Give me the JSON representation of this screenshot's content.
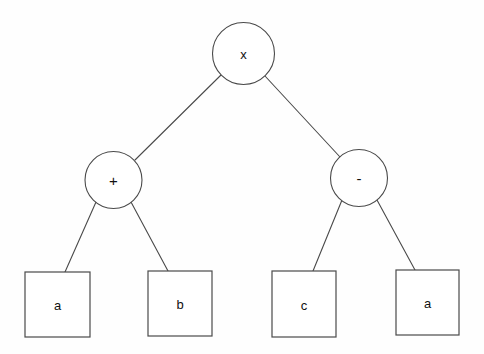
{
  "diagram": {
    "background_color": "#fefefe",
    "stroke_color": "#4a4a4a",
    "text_color": "#111111",
    "nodes": {
      "root": {
        "label": "x",
        "shape": "circle",
        "cx": 243.5,
        "cy": 53.5,
        "r": 31
      },
      "op_left": {
        "label": "+",
        "shape": "circle",
        "cx": 113.5,
        "cy": 180,
        "r": 28.5
      },
      "op_right": {
        "label": "-",
        "shape": "circle",
        "cx": 359,
        "cy": 178,
        "r": 28.5
      },
      "leaf_a1": {
        "label": "a",
        "shape": "square",
        "x": 25,
        "y": 272,
        "width": 65,
        "height": 65
      },
      "leaf_b": {
        "label": "b",
        "shape": "square",
        "x": 148,
        "y": 271,
        "width": 64,
        "height": 65
      },
      "leaf_c": {
        "label": "c",
        "shape": "square",
        "x": 272,
        "y": 271,
        "width": 64,
        "height": 66
      },
      "leaf_a2": {
        "label": "a",
        "shape": "square",
        "x": 396,
        "y": 270,
        "width": 63,
        "height": 65
      }
    },
    "edges": [
      {
        "from": "root",
        "to": "op_left",
        "x1": 221,
        "y1": 75,
        "x2": 135,
        "y2": 160
      },
      {
        "from": "root",
        "to": "op_right",
        "x1": 265,
        "y1": 76,
        "x2": 340,
        "y2": 157
      },
      {
        "from": "op_left",
        "to": "leaf_a1",
        "x1": 96,
        "y1": 202,
        "x2": 65,
        "y2": 272
      },
      {
        "from": "op_left",
        "to": "leaf_b",
        "x1": 131,
        "y1": 202,
        "x2": 168,
        "y2": 271
      },
      {
        "from": "op_right",
        "to": "leaf_c",
        "x1": 342,
        "y1": 200,
        "x2": 313,
        "y2": 271
      },
      {
        "from": "op_right",
        "to": "leaf_a2",
        "x1": 377,
        "y1": 200,
        "x2": 415,
        "y2": 270
      }
    ]
  }
}
